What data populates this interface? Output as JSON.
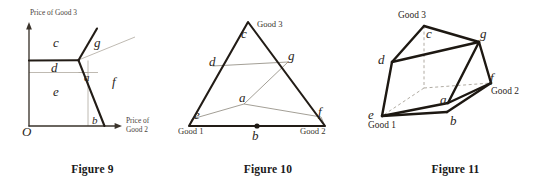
{
  "page": {
    "background_color": "#ffffff",
    "ink_color": "#221c16",
    "faint_line_color": "#a9a398"
  },
  "figures": [
    {
      "id": "figure-9",
      "caption": "Figure 9",
      "type": "price-space-diagram",
      "axes": {
        "y_label": "Price of Good 3",
        "x_label_line1": "Price of",
        "x_label_line2": "Good 2",
        "origin_label": "O"
      },
      "region_labels": [
        {
          "name": "c",
          "text": "c"
        },
        {
          "name": "d",
          "text": "d"
        },
        {
          "name": "e",
          "text": "e"
        },
        {
          "name": "a",
          "text": "a"
        },
        {
          "name": "b",
          "text": "b"
        },
        {
          "name": "f",
          "text": "f"
        },
        {
          "name": "g",
          "text": "g"
        }
      ]
    },
    {
      "id": "figure-10",
      "caption": "Figure 10",
      "type": "simplex-triangle-diagram",
      "vertex_labels": [
        {
          "name": "good-1",
          "text": "Good 1"
        },
        {
          "name": "good-2",
          "text": "Good 2"
        },
        {
          "name": "good-3",
          "text": "Good 3"
        }
      ],
      "region_labels": [
        {
          "name": "c",
          "text": "c"
        },
        {
          "name": "d",
          "text": "d"
        },
        {
          "name": "e",
          "text": "e"
        },
        {
          "name": "a",
          "text": "a"
        },
        {
          "name": "b",
          "text": "b"
        },
        {
          "name": "f",
          "text": "f"
        },
        {
          "name": "g",
          "text": "g"
        }
      ]
    },
    {
      "id": "figure-11",
      "caption": "Figure 11",
      "type": "three-dimensional-polytope-diagram",
      "vertex_labels": [
        {
          "name": "good-1",
          "text": "Good 1"
        },
        {
          "name": "good-2",
          "text": "Good 2"
        },
        {
          "name": "good-3",
          "text": "Good 3"
        }
      ],
      "region_labels": [
        {
          "name": "c",
          "text": "c"
        },
        {
          "name": "d",
          "text": "d"
        },
        {
          "name": "e",
          "text": "e"
        },
        {
          "name": "a",
          "text": "a"
        },
        {
          "name": "b",
          "text": "b"
        },
        {
          "name": "f",
          "text": "f"
        },
        {
          "name": "g",
          "text": "g"
        }
      ]
    }
  ]
}
